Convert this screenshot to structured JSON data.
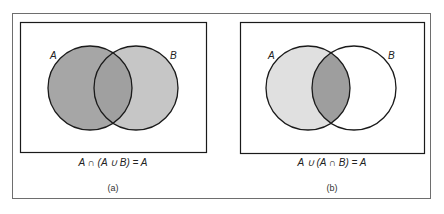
{
  "panels": [
    {
      "id": "a",
      "set_labels": [
        "A",
        "B"
      ],
      "formula": "A ∩ (A ∪ B) = A",
      "label": "(a)",
      "fills": {
        "a_only": "#a6a6a6",
        "intersection": "#a0a0a0",
        "b_only": "#c6c6c6"
      }
    },
    {
      "id": "b",
      "set_labels": [
        "A",
        "B"
      ],
      "formula": "A ∪ (A ∩ B) = A",
      "label": "(b)",
      "fills": {
        "a_only": "#e0e0e0",
        "intersection": "#9e9e9e",
        "b_only": "#ffffff"
      }
    }
  ],
  "colors": {
    "stroke": "#1a1a1a",
    "frame": "#6e6e6e",
    "background": "#ffffff"
  }
}
